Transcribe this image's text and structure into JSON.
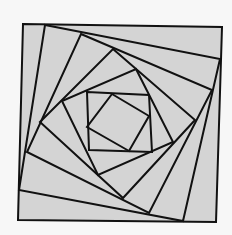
{
  "diagram": {
    "colors": {
      "background": "#f7f7f7",
      "fill": "#d4d4d4",
      "stroke": "#111111"
    },
    "squares": [
      [
        [
          23,
          24
        ],
        [
          222,
          27
        ],
        [
          216,
          222
        ],
        [
          18,
          220
        ]
      ],
      [
        [
          45,
          25
        ],
        [
          220,
          59
        ],
        [
          183,
          221
        ],
        [
          19,
          190
        ]
      ],
      [
        [
          81,
          34
        ],
        [
          212,
          90
        ],
        [
          149,
          213
        ],
        [
          27,
          152
        ]
      ],
      [
        [
          113,
          49
        ],
        [
          195,
          120
        ],
        [
          123,
          198
        ],
        [
          40,
          122
        ]
      ],
      [
        [
          136,
          69
        ],
        [
          173,
          142
        ],
        [
          98,
          175
        ],
        [
          62,
          101
        ]
      ],
      [
        [
          87,
          92
        ],
        [
          149,
          95
        ],
        [
          152,
          152
        ],
        [
          89,
          150
        ]
      ],
      [
        [
          112,
          94
        ],
        [
          149,
          116
        ],
        [
          129,
          151
        ],
        [
          87,
          127
        ]
      ]
    ]
  }
}
